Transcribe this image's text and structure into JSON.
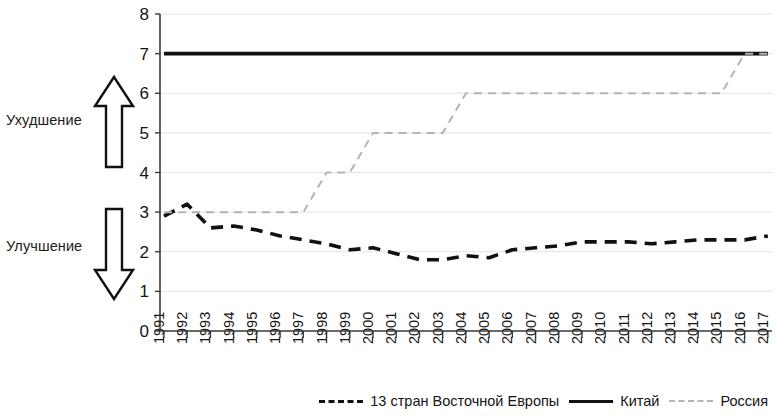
{
  "annotations": {
    "worsening": "Ухудшение",
    "improving": "Улучшение",
    "arrow_up_name": "arrow-up-icon",
    "arrow_down_name": "arrow-down-icon"
  },
  "legend": {
    "items": [
      {
        "label": "13 стран Восточной Европы",
        "style": "dashed",
        "color": "#111111"
      },
      {
        "label": "Китай",
        "style": "solid",
        "color": "#111111"
      },
      {
        "label": "Россия",
        "style": "dashed",
        "color": "#b4b4b4"
      }
    ]
  },
  "chart_data": {
    "type": "line",
    "title": "",
    "xlabel": "",
    "ylabel": "",
    "ylim": [
      0,
      8
    ],
    "yticks": [
      0,
      1,
      2,
      3,
      4,
      5,
      6,
      7,
      8
    ],
    "grid": true,
    "legend_position": "bottom",
    "x": [
      1991,
      1992,
      1993,
      1994,
      1995,
      1996,
      1997,
      1998,
      1999,
      2000,
      2001,
      2002,
      2003,
      2004,
      2005,
      2006,
      2007,
      2008,
      2009,
      2010,
      2011,
      2012,
      2013,
      2014,
      2015,
      2016,
      2017
    ],
    "categories": [
      "1991",
      "1992",
      "1993",
      "1994",
      "1995",
      "1996",
      "1997",
      "1998",
      "1999",
      "2000",
      "2001",
      "2002",
      "2003",
      "2004",
      "2005",
      "2006",
      "2007",
      "2008",
      "2009",
      "2010",
      "2011",
      "2012",
      "2013",
      "2014",
      "2015",
      "2016",
      "2017"
    ],
    "series": [
      {
        "name": "13 стран Восточной Европы",
        "style": "dashed",
        "color": "#111111",
        "values": [
          2.9,
          3.2,
          2.6,
          2.65,
          2.55,
          2.4,
          2.3,
          2.2,
          2.05,
          2.1,
          1.95,
          1.8,
          1.8,
          1.9,
          1.85,
          2.05,
          2.1,
          2.15,
          2.25,
          2.25,
          2.25,
          2.2,
          2.25,
          2.3,
          2.3,
          2.3,
          2.4
        ]
      },
      {
        "name": "Китай",
        "style": "solid",
        "color": "#111111",
        "values": [
          7,
          7,
          7,
          7,
          7,
          7,
          7,
          7,
          7,
          7,
          7,
          7,
          7,
          7,
          7,
          7,
          7,
          7,
          7,
          7,
          7,
          7,
          7,
          7,
          7,
          7,
          7
        ]
      },
      {
        "name": "Россия",
        "style": "dashed",
        "color": "#b4b4b4",
        "values": [
          3,
          3,
          3,
          3,
          3,
          3,
          3,
          4,
          4,
          5,
          5,
          5,
          5,
          6,
          6,
          6,
          6,
          6,
          6,
          6,
          6,
          6,
          6,
          6,
          6,
          7,
          7
        ]
      }
    ]
  }
}
